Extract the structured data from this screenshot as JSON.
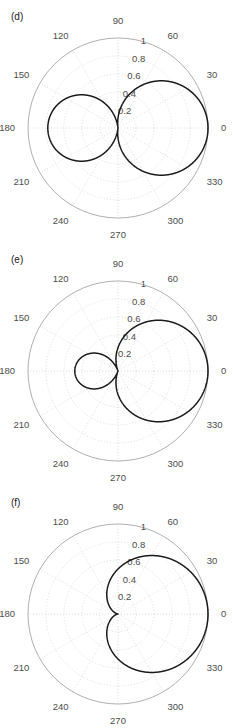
{
  "figure": {
    "type": "polar-plot-series",
    "panel_count": 3,
    "panels": [
      {
        "label": "(d)",
        "name": "panel-d",
        "pattern_param_a": 0.11,
        "front_lobe_max": 1.0,
        "back_lobe_max": 0.22
      },
      {
        "label": "(e)",
        "name": "panel-e",
        "pattern_param_a": 0.26,
        "front_lobe_max": 1.0,
        "back_lobe_max": 0.52
      },
      {
        "label": "(f)",
        "name": "panel-f",
        "pattern_param_a": 0.5,
        "front_lobe_max": 1.0,
        "back_lobe_max": 1.0
      }
    ]
  },
  "axes": {
    "angular_ticks": [
      "0",
      "30",
      "60",
      "90",
      "120",
      "150",
      "180",
      "210",
      "240",
      "270",
      "300",
      "330"
    ],
    "radial_ticks": [
      "0.2",
      "0.4",
      "0.6",
      "0.8",
      "1"
    ],
    "radial_values": [
      0.2,
      0.4,
      0.6,
      0.8,
      1
    ],
    "radial_label_angle_deg": 75,
    "rmax": 1,
    "grid": "on",
    "theta_direction": "counterclockwise",
    "theta_zero_location": "east"
  },
  "colors": {
    "curve": "#1a1a1a",
    "grid": "#c8c8c8",
    "outer_circle": "#9a9a9a",
    "text": "#4d4d4d",
    "label_text": "#1a1a1a",
    "background": "#ffffff"
  },
  "chart_data": [
    {
      "type": "line",
      "title": "(d)",
      "coordinate_system": "polar",
      "equation": "r = |a + (1-a)*cos(theta)|, a = 0.11",
      "xlabel": "",
      "ylabel": "",
      "rlim": [
        0,
        1
      ],
      "theta_ticks_deg": [
        0,
        30,
        60,
        90,
        120,
        150,
        180,
        210,
        240,
        270,
        300,
        330
      ],
      "r_ticks": [
        0.2,
        0.4,
        0.6,
        0.8,
        1
      ],
      "theta_deg": [
        0,
        10,
        20,
        30,
        40,
        50,
        60,
        70,
        80,
        90,
        100,
        110,
        120,
        130,
        140,
        150,
        160,
        170,
        180,
        190,
        200,
        210,
        220,
        230,
        240,
        250,
        260,
        270,
        280,
        290,
        300,
        310,
        320,
        330,
        340,
        350,
        360
      ],
      "r": [
        1.0,
        0.987,
        0.947,
        0.881,
        0.792,
        0.682,
        0.555,
        0.414,
        0.265,
        0.11,
        0.045,
        0.194,
        0.335,
        0.462,
        0.572,
        0.661,
        0.726,
        0.766,
        0.78,
        0.766,
        0.726,
        0.661,
        0.572,
        0.462,
        0.335,
        0.194,
        0.045,
        0.11,
        0.265,
        0.414,
        0.555,
        0.682,
        0.792,
        0.881,
        0.947,
        0.987,
        1.0
      ]
    },
    {
      "type": "line",
      "title": "(e)",
      "coordinate_system": "polar",
      "equation": "r = |a + (1-a)*cos(theta)|, a = 0.26",
      "xlabel": "",
      "ylabel": "",
      "rlim": [
        0,
        1
      ],
      "theta_ticks_deg": [
        0,
        30,
        60,
        90,
        120,
        150,
        180,
        210,
        240,
        270,
        300,
        330
      ],
      "r_ticks": [
        0.2,
        0.4,
        0.6,
        0.8,
        1
      ],
      "theta_deg": [
        0,
        10,
        20,
        30,
        40,
        50,
        60,
        70,
        80,
        90,
        100,
        110,
        120,
        130,
        140,
        150,
        160,
        170,
        180,
        190,
        200,
        210,
        220,
        230,
        240,
        250,
        260,
        270,
        280,
        290,
        300,
        310,
        320,
        330,
        340,
        350,
        360
      ],
      "r": [
        1.0,
        0.989,
        0.955,
        0.901,
        0.827,
        0.736,
        0.63,
        0.513,
        0.388,
        0.26,
        0.131,
        0.007,
        0.11,
        0.216,
        0.307,
        0.381,
        0.435,
        0.469,
        0.48,
        0.469,
        0.435,
        0.381,
        0.307,
        0.216,
        0.11,
        0.007,
        0.131,
        0.26,
        0.388,
        0.513,
        0.63,
        0.736,
        0.827,
        0.901,
        0.955,
        0.989,
        1.0
      ]
    },
    {
      "type": "line",
      "title": "(f)",
      "coordinate_system": "polar",
      "equation": "r = |cos(theta)|",
      "xlabel": "",
      "ylabel": "",
      "rlim": [
        0,
        1
      ],
      "theta_ticks_deg": [
        0,
        30,
        60,
        90,
        120,
        150,
        180,
        210,
        240,
        270,
        300,
        330
      ],
      "r_ticks": [
        0.2,
        0.4,
        0.6,
        0.8,
        1
      ],
      "theta_deg": [
        0,
        10,
        20,
        30,
        40,
        50,
        60,
        70,
        80,
        90,
        100,
        110,
        120,
        130,
        140,
        150,
        160,
        170,
        180,
        190,
        200,
        210,
        220,
        230,
        240,
        250,
        260,
        270,
        280,
        290,
        300,
        310,
        320,
        330,
        340,
        350,
        360
      ],
      "r": [
        1.0,
        0.985,
        0.94,
        0.866,
        0.766,
        0.643,
        0.5,
        0.342,
        0.174,
        0.0,
        0.174,
        0.342,
        0.5,
        0.643,
        0.766,
        0.866,
        0.94,
        0.985,
        1.0,
        0.985,
        0.94,
        0.866,
        0.766,
        0.643,
        0.5,
        0.342,
        0.174,
        0.0,
        0.174,
        0.342,
        0.5,
        0.643,
        0.766,
        0.866,
        0.94,
        0.985,
        1.0
      ]
    }
  ]
}
